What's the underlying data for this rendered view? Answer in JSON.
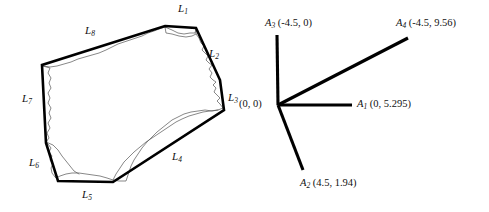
{
  "figure": {
    "title": "",
    "background_color": "#ffffff",
    "stroke_color": "#000000",
    "outline_color": "#555555"
  },
  "left_panel": {
    "name": "convex-hull-polygon",
    "description": "Irregular rock cross-section with convex hull edges labelled L1 through L8",
    "edge_labels": [
      {
        "id": "L1",
        "base": "L",
        "sub": "1",
        "x": 178,
        "y": 3
      },
      {
        "id": "L2",
        "base": "L",
        "sub": "2",
        "x": 209,
        "y": 48
      },
      {
        "id": "L3",
        "base": "L",
        "sub": "3",
        "x": 228,
        "y": 92
      },
      {
        "id": "L4",
        "base": "L",
        "sub": "4",
        "x": 172,
        "y": 151
      },
      {
        "id": "L5",
        "base": "L",
        "sub": "5",
        "x": 82,
        "y": 189
      },
      {
        "id": "L6",
        "base": "L",
        "sub": "6",
        "x": 29,
        "y": 157
      },
      {
        "id": "L7",
        "base": "L",
        "sub": "7",
        "x": 22,
        "y": 93
      },
      {
        "id": "L8",
        "base": "L",
        "sub": "8",
        "x": 85,
        "y": 25
      }
    ],
    "hull_vertices": [
      [
        165,
        26
      ],
      [
        196,
        28
      ],
      [
        220,
        80
      ],
      [
        224,
        110
      ],
      [
        113,
        182
      ],
      [
        58,
        181
      ],
      [
        46,
        143
      ],
      [
        42,
        65
      ]
    ]
  },
  "right_panel": {
    "name": "vector-diagram",
    "description": "Four vectors radiating from the origin with coordinate labels",
    "origin_label": "(0, 0)",
    "vectors": [
      {
        "id": "A1",
        "base": "A",
        "sub": "1",
        "coords": "(0, 5.295)",
        "from": [
          278,
          105
        ],
        "to": [
          352,
          105
        ],
        "label_x": 357,
        "label_y": 99
      },
      {
        "id": "A2",
        "base": "A",
        "sub": "2",
        "coords": "(4.5, 1.94)",
        "from": [
          278,
          105
        ],
        "to": [
          303,
          170
        ],
        "label_x": 300,
        "label_y": 178
      },
      {
        "id": "A3",
        "base": "A",
        "sub": "3",
        "coords": "(-4.5, 0)",
        "from": [
          278,
          105
        ],
        "to": [
          277,
          35
        ],
        "label_x": 265,
        "label_y": 18
      },
      {
        "id": "A4",
        "base": "A",
        "sub": "4",
        "coords": "(-4.5, 9.56)",
        "from": [
          278,
          105
        ],
        "to": [
          408,
          38
        ],
        "label_x": 396,
        "label_y": 18
      }
    ],
    "origin_label_x": 239,
    "origin_label_y": 99
  }
}
